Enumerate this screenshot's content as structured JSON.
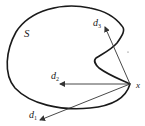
{
  "diagram": {
    "set_label": "S",
    "point_label": "x",
    "vectors": [
      {
        "name": "d1",
        "label": "d",
        "subscript": "1"
      },
      {
        "name": "d2",
        "label": "d",
        "subscript": "2"
      },
      {
        "name": "d3",
        "label": "d",
        "subscript": "3"
      }
    ],
    "colors": {
      "stroke": "#1a1a1a",
      "arrow": "#333333"
    }
  }
}
